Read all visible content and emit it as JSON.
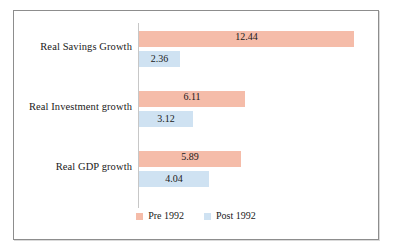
{
  "chart_data": {
    "type": "bar",
    "orientation": "horizontal",
    "title": "",
    "subtitle": "",
    "xlabel": "",
    "ylabel": "",
    "grid": false,
    "legend_position": "bottom-center",
    "xlim": [
      0,
      12.44
    ],
    "categories": [
      "Real Savings Growth",
      "Real Investment growth",
      "Real GDP growth"
    ],
    "series": [
      {
        "name": "Pre 1992",
        "color": "#f5bca9",
        "values": [
          12.44,
          6.11,
          5.89
        ]
      },
      {
        "name": "Post 1992",
        "color": "#cfe2f2",
        "values": [
          2.36,
          3.12,
          4.04
        ]
      }
    ],
    "value_labels": [
      [
        "12.44",
        "2.36"
      ],
      [
        "6.11",
        "3.12"
      ],
      [
        "5.89",
        "4.04"
      ]
    ]
  },
  "legend": {
    "items": [
      {
        "label": "Pre 1992",
        "color": "#f5bca9",
        "swatch_name": "legend-swatch-pre-1992"
      },
      {
        "label": "Post 1992",
        "color": "#cfe2f2",
        "swatch_name": "legend-swatch-post-1992"
      }
    ]
  },
  "colors": {
    "pre_1992": "#f5bca9",
    "post_1992": "#cfe2f2",
    "frame_border": "#8d8d8d",
    "axis_line": "#c7c7c7",
    "text": "#1a1a1a",
    "background": "#ffffff"
  }
}
